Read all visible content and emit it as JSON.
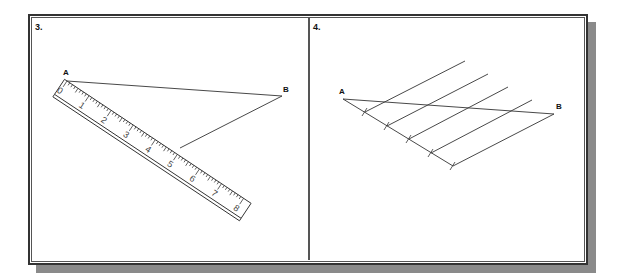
{
  "panels": [
    {
      "number": "3.",
      "points": {
        "A": "A",
        "B": "B"
      },
      "ruler": {
        "labels": [
          "0",
          "1",
          "2",
          "3",
          "4",
          "5",
          "6",
          "7",
          "8"
        ]
      }
    },
    {
      "number": "4.",
      "points": {
        "A": "A",
        "B": "B"
      }
    }
  ],
  "colors": {
    "line": "#333333",
    "shadow": "#8a8a8a",
    "frame": "#333333"
  }
}
